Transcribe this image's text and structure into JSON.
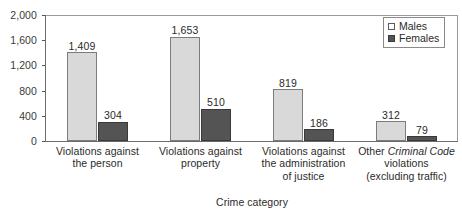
{
  "chart_data": {
    "type": "bar",
    "title": "",
    "subtitle": "",
    "xlabel": "Crime category",
    "ylabel": "",
    "ylim": [
      0,
      2000
    ],
    "y_ticks": [
      0,
      400,
      800,
      1200,
      1600,
      2000
    ],
    "y_tick_labels": [
      "0",
      "400",
      "800",
      "1,200",
      "1,600",
      "2,000"
    ],
    "grid": false,
    "legend_position": "top-right",
    "categories": [
      "Violations against the person",
      "Violations against property",
      "Violations against the administration of justice",
      "Other Criminal Code violations (excluding traffic)"
    ],
    "category_lines": [
      [
        "Violations against",
        "the person"
      ],
      [
        "Violations against",
        "property"
      ],
      [
        "Violations against",
        "the administration",
        "of justice"
      ],
      [
        "Other Criminal Code",
        "violations",
        "(excluding traffic)"
      ]
    ],
    "series": [
      {
        "name": "Males",
        "color": "#d9d9d9",
        "values": [
          1409,
          1653,
          819,
          312
        ],
        "labels": [
          "1,409",
          "1,653",
          "819",
          "312"
        ]
      },
      {
        "name": "Females",
        "color": "#545454",
        "values": [
          304,
          510,
          186,
          79
        ],
        "labels": [
          "304",
          "510",
          "186",
          "79"
        ]
      }
    ]
  },
  "legend": {
    "items": [
      {
        "label": "Males",
        "swatch": "light-square"
      },
      {
        "label": "Females",
        "swatch": "dark-square"
      }
    ]
  },
  "axes": {
    "x_title": "Crime category"
  },
  "colors": {
    "males_fill": "#d9d9d9",
    "males_stroke": "#7c7c7c",
    "females_fill": "#545454",
    "females_stroke": "#3a3a3a",
    "axis": "#6b6b6b",
    "frame": "#9a9a9a",
    "text": "#2b2b2b",
    "background": "#ffffff"
  }
}
